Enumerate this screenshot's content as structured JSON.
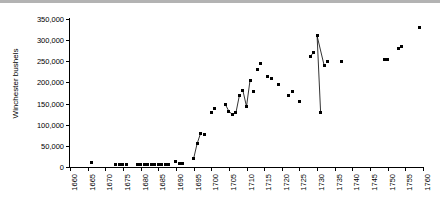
{
  "chart_data": {
    "type": "scatter",
    "title": "",
    "xlabel": "",
    "ylabel": "Winchester bushels",
    "xlim": [
      1660,
      1760
    ],
    "ylim": [
      0,
      350000
    ],
    "grid": false,
    "legend": null,
    "y_ticks": [
      0,
      50000,
      100000,
      150000,
      200000,
      250000,
      300000,
      350000
    ],
    "y_tick_labels": [
      "0",
      "50,000",
      "100,000",
      "150,000",
      "200,000",
      "250,000",
      "300,000",
      "350,000"
    ],
    "x_ticks": [
      1660,
      1665,
      1670,
      1675,
      1680,
      1685,
      1690,
      1695,
      1700,
      1705,
      1710,
      1715,
      1720,
      1725,
      1730,
      1735,
      1740,
      1745,
      1750,
      1755,
      1760
    ],
    "x_tick_labels": [
      "1660",
      "1665",
      "1670",
      "1675",
      "1680",
      "1685",
      "1690",
      "1695",
      "1700",
      "1705",
      "1710",
      "1715",
      "1720",
      "1725",
      "1730",
      "1735",
      "1740",
      "1745",
      "1750",
      "1755",
      "1760"
    ],
    "marker_color": "#000000",
    "line_color": "#000000",
    "series": [
      {
        "name": "Winchester bushels",
        "x": [
          1666,
          1673,
          1674,
          1675,
          1676,
          1679,
          1680,
          1681,
          1682,
          1683,
          1684,
          1685,
          1686,
          1687,
          1688,
          1690,
          1691,
          1692,
          1695,
          1696,
          1697,
          1698,
          1700,
          1701,
          1704,
          1705,
          1706,
          1707,
          1708,
          1709,
          1710,
          1711,
          1712,
          1713,
          1714,
          1716,
          1717,
          1719,
          1722,
          1723,
          1725,
          1728,
          1729,
          1730,
          1731,
          1732,
          1733,
          1737,
          1749,
          1750,
          1753,
          1754,
          1759
        ],
        "y": [
          11000,
          5000,
          5000,
          5000,
          5000,
          5000,
          5000,
          5000,
          5000,
          5000,
          5000,
          5000,
          5000,
          5000,
          5000,
          13000,
          9000,
          9000,
          19000,
          55000,
          80000,
          78000,
          130000,
          138000,
          148000,
          132000,
          124000,
          128000,
          170000,
          180000,
          143000,
          205000,
          178000,
          230000,
          245000,
          215000,
          210000,
          196000,
          170000,
          178000,
          155000,
          262000,
          270000,
          310000,
          128000,
          240000,
          250000,
          250000,
          255000,
          255000,
          280000,
          285000,
          330000
        ]
      }
    ],
    "connected_segments": [
      [
        [
          1695,
          19000
        ],
        [
          1696,
          55000
        ],
        [
          1697,
          80000
        ]
      ],
      [
        [
          1704,
          148000
        ],
        [
          1705,
          132000
        ],
        [
          1706,
          124000
        ],
        [
          1707,
          128000
        ],
        [
          1708,
          170000
        ]
      ],
      [
        [
          1709,
          180000
        ],
        [
          1710,
          143000
        ],
        [
          1711,
          205000
        ]
      ],
      [
        [
          1728,
          262000
        ],
        [
          1729,
          270000
        ]
      ],
      [
        [
          1730,
          310000
        ],
        [
          1731,
          128000
        ]
      ],
      [
        [
          1730,
          310000
        ],
        [
          1732,
          240000
        ]
      ],
      [
        [
          1749,
          255000
        ],
        [
          1750,
          255000
        ]
      ],
      [
        [
          1753,
          280000
        ],
        [
          1754,
          285000
        ]
      ]
    ]
  }
}
